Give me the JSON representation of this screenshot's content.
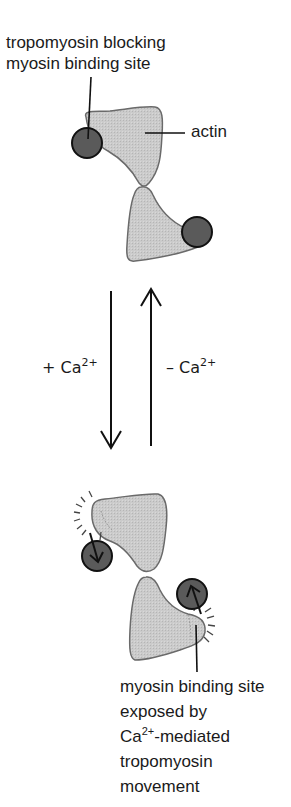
{
  "diagram": {
    "top_state": {
      "callout_line1": "tropomyosin blocking",
      "callout_line2": "myosin binding site",
      "actin_label": "actin"
    },
    "transitions": {
      "forward": {
        "sign": "+ Ca",
        "superscript": "2+",
        "direction": "down"
      },
      "reverse": {
        "sign": "– Ca",
        "superscript": "2+",
        "direction": "up"
      }
    },
    "bottom_state": {
      "callout_line1": "myosin binding site",
      "callout_line2": "exposed by",
      "callout_line3_prefix": "Ca",
      "callout_line3_sup": "2+",
      "callout_line3_suffix": "-mediated",
      "callout_line4": "tropomyosin",
      "callout_line5": "movement"
    },
    "colors": {
      "actin_fill": "#c9c9c9",
      "actin_stroke": "#6a6a6a",
      "tropomyosin_fill": "#5a5a5a",
      "tropomyosin_stroke": "#111111",
      "line": "#111111"
    }
  }
}
